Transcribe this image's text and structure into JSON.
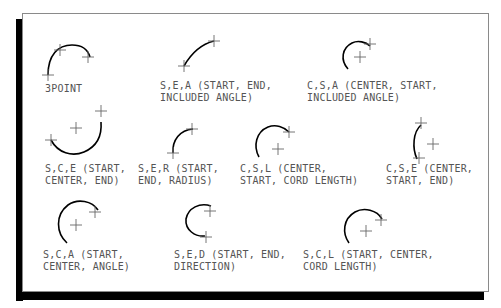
{
  "diagram": {
    "items": [
      {
        "id": "3point",
        "line1": "3POINT",
        "line2": ""
      },
      {
        "id": "sea",
        "line1": "S,E,A (START, END,",
        "line2": "INCLUDED ANGLE)"
      },
      {
        "id": "csa",
        "line1": "C,S,A (CENTER, START,",
        "line2": "INCLUDED ANGLE)"
      },
      {
        "id": "sce",
        "line1": "S,C,E (START,",
        "line2": "CENTER, END)"
      },
      {
        "id": "ser",
        "line1": "S,E,R (START,",
        "line2": "END, RADIUS)"
      },
      {
        "id": "csl",
        "line1": "C,S,L (CENTER,",
        "line2": "START, CORD LENGTH)"
      },
      {
        "id": "cse",
        "line1": "C,S,E (CENTER,",
        "line2": "START, END)"
      },
      {
        "id": "sca",
        "line1": "S,C,A (START,",
        "line2": "CENTER, ANGLE)"
      },
      {
        "id": "sed",
        "line1": "S,E,D (START, END,",
        "line2": "DIRECTION)"
      },
      {
        "id": "scl",
        "line1": "S,C,L (START, CENTER,",
        "line2": "CORD LENGTH)"
      }
    ]
  }
}
